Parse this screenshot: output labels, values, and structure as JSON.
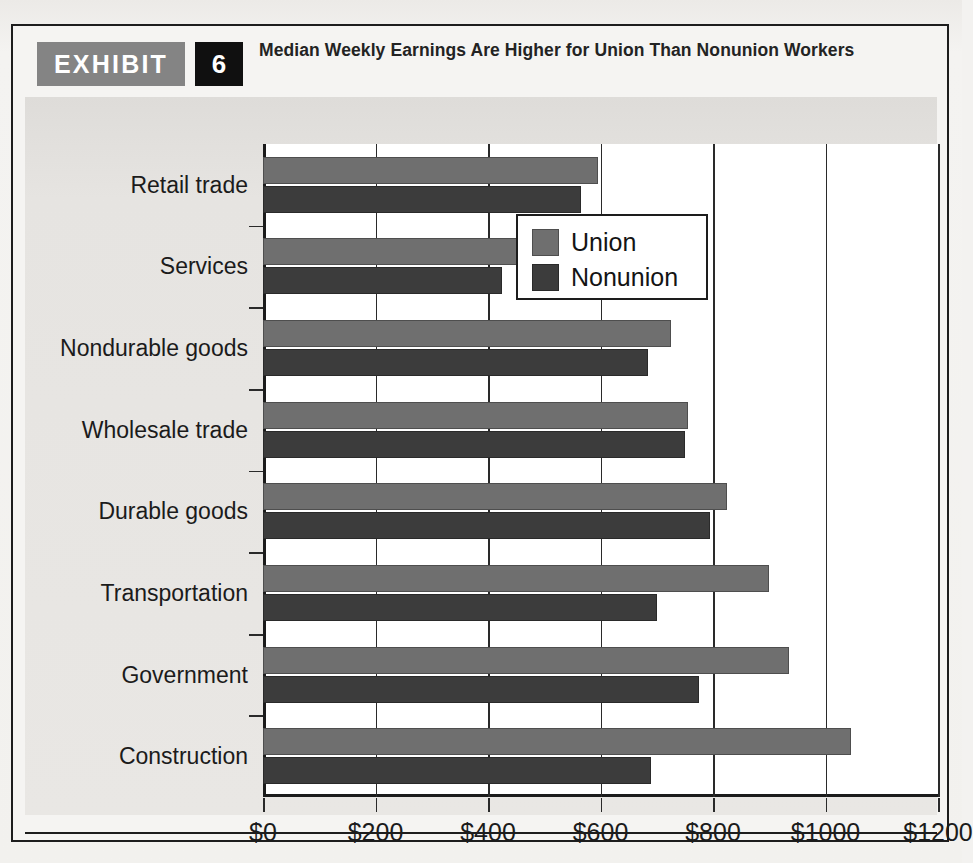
{
  "exhibit": {
    "tag": "EXHIBIT",
    "number": "6",
    "title": "Median Weekly Earnings Are Higher for Union Than Nonunion Workers"
  },
  "legend": {
    "items": [
      {
        "label": "Union",
        "color": "#6f6f6f"
      },
      {
        "label": "Nonunion",
        "color": "#3c3c3c"
      }
    ]
  },
  "chart_data": {
    "type": "bar",
    "orientation": "horizontal",
    "title": "Median Weekly Earnings Are Higher for Union Than Nonunion Workers",
    "xlabel": "",
    "ylabel": "",
    "xlim": [
      0,
      1200
    ],
    "xticks": [
      0,
      200,
      400,
      600,
      800,
      1000,
      1200
    ],
    "xticklabels": [
      "$0",
      "$200",
      "$400",
      "$600",
      "$800",
      "$1000",
      "$1200"
    ],
    "grid": true,
    "legend_position": "upper right",
    "categories": [
      "Retail trade",
      "Services",
      "Nondurable goods",
      "Wholesale trade",
      "Durable goods",
      "Transportation",
      "Government",
      "Construction"
    ],
    "series": [
      {
        "name": "Union",
        "color": "#6f6f6f",
        "values": [
          595,
          670,
          725,
          755,
          825,
          900,
          935,
          1045
        ]
      },
      {
        "name": "Nonunion",
        "color": "#3c3c3c",
        "values": [
          565,
          425,
          685,
          750,
          795,
          700,
          775,
          690
        ]
      }
    ]
  }
}
